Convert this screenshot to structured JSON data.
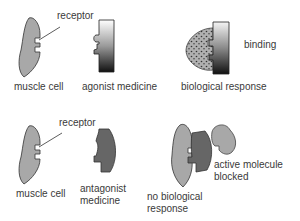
{
  "top": {
    "receptor_label": "receptor",
    "muscle_cell_label": "muscle cell",
    "agonist_label": "agonist medicine",
    "response_label": "biological response",
    "binding_label": "binding"
  },
  "bottom": {
    "receptor_label": "receptor",
    "muscle_cell_label": "muscle cell",
    "antagonist_label_line1": "antagonist",
    "antagonist_label_line2": "medicine",
    "no_response_line1": "no biological",
    "no_response_line2": "response",
    "blocked_line1": "active molecule",
    "blocked_line2": "blocked"
  },
  "colors": {
    "cell_fill": "#a8a8a8",
    "antagonist_fill": "#666666",
    "outline": "#333333"
  }
}
